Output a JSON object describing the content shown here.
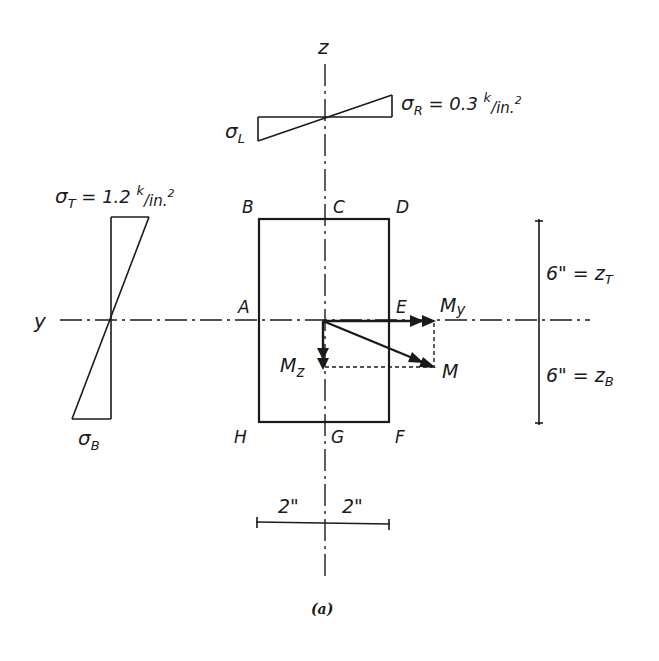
{
  "figure": {
    "caption": "(a)",
    "colors": {
      "ink": "#1a1a1a",
      "background": "#ffffff"
    }
  },
  "axes": {
    "z_label": "z",
    "y_label": "y"
  },
  "section": {
    "corners": {
      "A": "A",
      "B": "B",
      "C": "C",
      "D": "D",
      "E": "E",
      "F": "F",
      "G": "G",
      "H": "H"
    }
  },
  "moments": {
    "My": "M",
    "My_sub": "y",
    "Mz": "M",
    "Mz_sub": "z",
    "M": "M"
  },
  "stress_top": {
    "left_label": "σ",
    "left_sub": "L",
    "right_label": "σ",
    "right_sub": "R",
    "right_value": " = 0.3 ",
    "unit_k": "k",
    "unit_rest": "/in.",
    "unit_exp": "2"
  },
  "stress_left": {
    "top_label": "σ",
    "top_sub": "T",
    "top_value": " = 1.2 ",
    "unit_k": "k",
    "unit_rest": "/in.",
    "unit_exp": "2",
    "bottom_label": "σ",
    "bottom_sub": "B"
  },
  "dimensions": {
    "top_half": "6\" = z",
    "top_half_sub": "T",
    "bottom_half": "6\" = z",
    "bottom_half_sub": "B",
    "left_width": "2\"",
    "right_width": "2\""
  }
}
